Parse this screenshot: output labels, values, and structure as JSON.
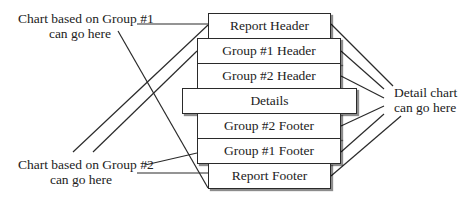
{
  "diagram": {
    "bands": [
      {
        "id": "report-header",
        "label": "Report Header"
      },
      {
        "id": "group1-header",
        "label": "Group #1 Header"
      },
      {
        "id": "group2-header",
        "label": "Group #2 Header"
      },
      {
        "id": "details",
        "label": "Details"
      },
      {
        "id": "group2-footer",
        "label": "Group #2 Footer"
      },
      {
        "id": "group1-footer",
        "label": "Group #1 Footer"
      },
      {
        "id": "report-footer",
        "label": "Report Footer"
      }
    ],
    "annotations": {
      "group1_chart": {
        "line1": "Chart based on Group #1",
        "line2": "can go here"
      },
      "group2_chart": {
        "line1": "Chart based on Group #2",
        "line2": "can go here"
      },
      "detail_chart": {
        "line1": "Detail chart",
        "line2": "can go here"
      }
    },
    "colors": {
      "line": "#2a2a2a",
      "background": "#ffffff",
      "text": "#222222"
    }
  }
}
